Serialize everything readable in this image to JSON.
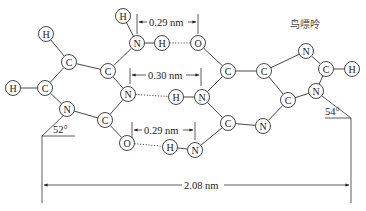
{
  "figure": {
    "title": "鸟嘌呤"
  },
  "atoms": [
    {
      "id": "a1",
      "el": "H",
      "x": 123,
      "y": 16
    },
    {
      "id": "a2",
      "el": "H",
      "x": 46,
      "y": 34
    },
    {
      "id": "a3",
      "el": "N",
      "x": 137,
      "y": 43
    },
    {
      "id": "a4",
      "el": "H",
      "x": 162,
      "y": 43
    },
    {
      "id": "a5",
      "el": "C",
      "x": 69,
      "y": 62
    },
    {
      "id": "a6",
      "el": "C",
      "x": 108,
      "y": 71
    },
    {
      "id": "a7",
      "el": "H",
      "x": 13,
      "y": 88
    },
    {
      "id": "a8",
      "el": "C",
      "x": 45,
      "y": 88
    },
    {
      "id": "a9",
      "el": "N",
      "x": 128,
      "y": 94
    },
    {
      "id": "a10",
      "el": "H",
      "x": 176,
      "y": 97
    },
    {
      "id": "a11",
      "el": "N",
      "x": 67,
      "y": 109
    },
    {
      "id": "a12",
      "el": "C",
      "x": 105,
      "y": 120
    },
    {
      "id": "a13",
      "el": "O",
      "x": 127,
      "y": 143
    },
    {
      "id": "a14",
      "el": "H",
      "x": 170,
      "y": 147
    },
    {
      "id": "b1",
      "el": "O",
      "x": 198,
      "y": 43
    },
    {
      "id": "b2",
      "el": "C",
      "x": 228,
      "y": 71
    },
    {
      "id": "b3",
      "el": "C",
      "x": 264,
      "y": 71
    },
    {
      "id": "b4",
      "el": "N",
      "x": 306,
      "y": 51
    },
    {
      "id": "b5",
      "el": "C",
      "x": 326,
      "y": 69
    },
    {
      "id": "b6",
      "el": "H",
      "x": 352,
      "y": 69
    },
    {
      "id": "b7",
      "el": "N",
      "x": 202,
      "y": 97
    },
    {
      "id": "b8",
      "el": "N",
      "x": 316,
      "y": 91
    },
    {
      "id": "b9",
      "el": "C",
      "x": 288,
      "y": 100
    },
    {
      "id": "b10",
      "el": "C",
      "x": 228,
      "y": 123
    },
    {
      "id": "b11",
      "el": "N",
      "x": 263,
      "y": 126
    },
    {
      "id": "b12",
      "el": "N",
      "x": 195,
      "y": 150
    }
  ],
  "bonds": [
    [
      "a1",
      "a3"
    ],
    [
      "a3",
      "a4"
    ],
    [
      "a3",
      "a6"
    ],
    [
      "a2",
      "a5"
    ],
    [
      "a5",
      "a6"
    ],
    [
      "a5",
      "a8"
    ],
    [
      "a7",
      "a8"
    ],
    [
      "a8",
      "a11"
    ],
    [
      "a6",
      "a9"
    ],
    [
      "a9",
      "a12"
    ],
    [
      "a11",
      "a12"
    ],
    [
      "a12",
      "a13"
    ],
    [
      "a14",
      "b12"
    ],
    [
      "b1",
      "b2"
    ],
    [
      "b2",
      "b3"
    ],
    [
      "b2",
      "b7"
    ],
    [
      "b3",
      "b4"
    ],
    [
      "b4",
      "b5"
    ],
    [
      "b5",
      "b6"
    ],
    [
      "b5",
      "b8"
    ],
    [
      "b8",
      "b9"
    ],
    [
      "b9",
      "b3"
    ],
    [
      "b7",
      "b10"
    ],
    [
      "b7",
      "a10"
    ],
    [
      "b10",
      "b11"
    ],
    [
      "b11",
      "b9"
    ],
    [
      "b10",
      "b12"
    ]
  ],
  "hbonds": [
    [
      "a4",
      "b1"
    ],
    [
      "a9",
      "a10"
    ],
    [
      "a13",
      "a14"
    ]
  ],
  "dimensions": {
    "top": {
      "label": "0.29 nm",
      "x1": 137,
      "x2": 198,
      "y": 22
    },
    "middle": {
      "label": "0.30 nm",
      "x1": 128,
      "x2": 202,
      "y": 75
    },
    "bottom": {
      "label": "0.29 nm",
      "x1": 132,
      "x2": 195,
      "y": 129
    },
    "overall": {
      "label": "2.08 nm",
      "x1": 42,
      "x2": 351,
      "y": 185
    }
  },
  "angles": {
    "left": {
      "label": "52°"
    },
    "right": {
      "label": "54°"
    }
  }
}
